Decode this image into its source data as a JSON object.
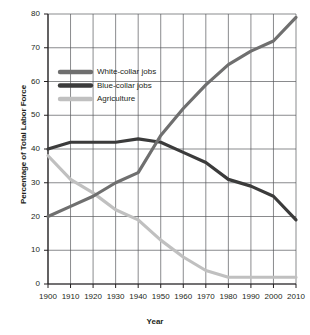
{
  "chart_data": {
    "type": "line",
    "title": "",
    "xlabel": "Year",
    "ylabel": "Percentage of Total Labor Force",
    "xlim": [
      1900,
      2010
    ],
    "ylim": [
      0,
      80
    ],
    "grid": true,
    "legend_position": "upper-left-inset",
    "x": [
      1900,
      1910,
      1920,
      1930,
      1940,
      1950,
      1960,
      1970,
      1980,
      1990,
      2000,
      2010
    ],
    "xticklabels": [
      "1900",
      "1910",
      "1920",
      "1930",
      "1940",
      "1950",
      "1960",
      "1970",
      "1980",
      "1990",
      "2000",
      "2010"
    ],
    "yticks": [
      0,
      10,
      20,
      30,
      40,
      50,
      60,
      70,
      80
    ],
    "yticklabels": [
      "0",
      "10",
      "20",
      "30",
      "40",
      "50",
      "60",
      "70",
      "80"
    ],
    "series": [
      {
        "name": "White-collar jobs",
        "color": "#6f6f6f",
        "values": [
          20,
          23,
          26,
          30,
          33,
          44,
          52,
          59,
          65,
          69,
          72,
          79
        ]
      },
      {
        "name": "Blue-collar jobs",
        "color": "#3b3b3b",
        "values": [
          40,
          42,
          42,
          42,
          43,
          42,
          39,
          36,
          31,
          29,
          26,
          19
        ]
      },
      {
        "name": "Agriculture",
        "color": "#c0c0c0",
        "values": [
          38,
          31,
          27,
          22,
          19,
          13,
          8,
          4,
          2,
          2,
          2,
          2
        ]
      }
    ]
  },
  "legend": {
    "items": [
      {
        "label": "White-collar jobs",
        "color": "#6f6f6f"
      },
      {
        "label": "Blue-collar jobs",
        "color": "#3b3b3b"
      },
      {
        "label": "Agriculture",
        "color": "#c0c0c0"
      }
    ]
  },
  "axes": {
    "x_title": "Year",
    "y_title": "Percentage of Total Labor Force"
  }
}
